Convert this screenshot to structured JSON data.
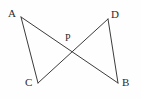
{
  "figure": {
    "kind": "geometry-diagram",
    "background_color": "#fefefe",
    "line_color": "#3b3b3b",
    "label_color": "#2b2b2b",
    "width": 141,
    "height": 99,
    "points": [
      {
        "id": "A",
        "label": "A",
        "x": 21,
        "y": 17
      },
      {
        "id": "D",
        "label": "D",
        "x": 108,
        "y": 19
      },
      {
        "id": "P",
        "label": "P",
        "x": 70,
        "y": 49
      },
      {
        "id": "C",
        "label": "C",
        "x": 38,
        "y": 83
      },
      {
        "id": "B",
        "label": "B",
        "x": 118,
        "y": 83
      }
    ],
    "segments": [
      {
        "id": "AC",
        "from": "A",
        "to": "C",
        "x1": 21,
        "y1": 17,
        "x2": 38,
        "y2": 83
      },
      {
        "id": "AB",
        "from": "A",
        "to": "B",
        "x1": 21,
        "y1": 17,
        "x2": 118,
        "y2": 83
      },
      {
        "id": "CD",
        "from": "C",
        "to": "D",
        "x1": 38,
        "y1": 83,
        "x2": 108,
        "y2": 19
      },
      {
        "id": "DB",
        "from": "D",
        "to": "B",
        "x1": 108,
        "y1": 19,
        "x2": 118,
        "y2": 83
      }
    ]
  }
}
